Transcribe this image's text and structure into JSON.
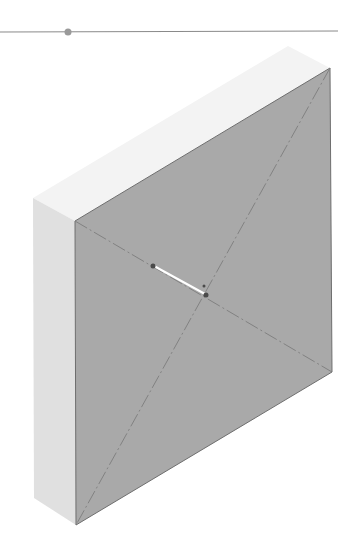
{
  "slider": {
    "track": {
      "x1": 0,
      "y1": 32,
      "x2": 338,
      "y2": 31
    },
    "handle": {
      "cx": 68,
      "cy": 32,
      "r": 3.5
    },
    "track_color": "#8a8a8a",
    "handle_color": "#9a9a9a"
  },
  "model": {
    "top_face": {
      "points": "75,221 330,68 288,46 33,198",
      "color": "#f3f3f3"
    },
    "left_face": {
      "points": "33,198 75,221 76,525 34,498",
      "color": "#e0e0e0"
    },
    "front_face": {
      "points": "75,221 330,68 332,372 76,525",
      "color": "#a9a9a9",
      "edge_color": "#6e6e6e"
    },
    "diagonals": [
      {
        "x1": 75,
        "y1": 221,
        "x2": 332,
        "y2": 372
      },
      {
        "x1": 330,
        "y1": 68,
        "x2": 76,
        "y2": 525
      }
    ],
    "diagonal_color": "#7d7d7d",
    "measure_line": {
      "x1": 154,
      "y1": 266,
      "x2": 205,
      "y2": 294,
      "color": "#ffffff"
    },
    "markers": [
      {
        "name": "start-point",
        "cx": 153,
        "cy": 266,
        "r": 2.5
      },
      {
        "name": "end-point",
        "cx": 206,
        "cy": 295,
        "r": 2.5
      },
      {
        "name": "center-point",
        "cx": 204,
        "cy": 286,
        "r": 1.5
      }
    ],
    "marker_color": "#4a4a4a"
  }
}
